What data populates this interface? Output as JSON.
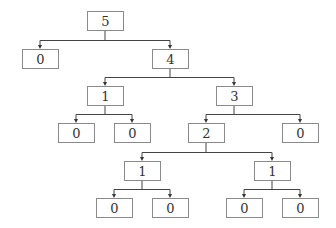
{
  "diagram": {
    "type": "tree",
    "colors": {
      "box_border": "#8a8a8a",
      "edge": "#444444",
      "text": "#333333",
      "background": "#ffffff"
    },
    "box": {
      "width": 36,
      "height": 19
    },
    "nodes": [
      {
        "id": "n0",
        "label": "5",
        "x": 87,
        "y": 11
      },
      {
        "id": "n1",
        "label": "0",
        "x": 22,
        "y": 49
      },
      {
        "id": "n2",
        "label": "4",
        "x": 152,
        "y": 49
      },
      {
        "id": "n3",
        "label": "1",
        "x": 87,
        "y": 86
      },
      {
        "id": "n4",
        "label": "3",
        "x": 216,
        "y": 86
      },
      {
        "id": "n5",
        "label": "0",
        "x": 58,
        "y": 123
      },
      {
        "id": "n6",
        "label": "0",
        "x": 114,
        "y": 123
      },
      {
        "id": "n7",
        "label": "2",
        "x": 188,
        "y": 123
      },
      {
        "id": "n8",
        "label": "0",
        "x": 282,
        "y": 123
      },
      {
        "id": "n9",
        "label": "1",
        "x": 124,
        "y": 161
      },
      {
        "id": "n10",
        "label": "1",
        "x": 254,
        "y": 161
      },
      {
        "id": "n11",
        "label": "0",
        "x": 96,
        "y": 198
      },
      {
        "id": "n12",
        "label": "0",
        "x": 152,
        "y": 198
      },
      {
        "id": "n13",
        "label": "0",
        "x": 226,
        "y": 198
      },
      {
        "id": "n14",
        "label": "0",
        "x": 282,
        "y": 198
      }
    ],
    "edges": [
      {
        "parent": "n0",
        "children": [
          "n1",
          "n2"
        ]
      },
      {
        "parent": "n2",
        "children": [
          "n3",
          "n4"
        ]
      },
      {
        "parent": "n3",
        "children": [
          "n5",
          "n6"
        ]
      },
      {
        "parent": "n4",
        "children": [
          "n7",
          "n8"
        ]
      },
      {
        "parent": "n7",
        "children": [
          "n9",
          "n10"
        ]
      },
      {
        "parent": "n9",
        "children": [
          "n11",
          "n12"
        ]
      },
      {
        "parent": "n10",
        "children": [
          "n13",
          "n14"
        ]
      }
    ]
  }
}
